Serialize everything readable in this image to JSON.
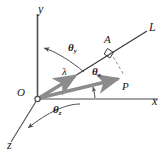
{
  "figure": {
    "colors": {
      "axis": "#4d4d4d",
      "line": "#3a3a3a",
      "vector": "#8c8c8c",
      "arc": "#4d4d4d",
      "text": "#1a1a1a",
      "background": "#ffffff"
    },
    "axes": [
      {
        "name": "y-axis",
        "label": "y",
        "x": 40,
        "y": 8
      },
      {
        "name": "x-axis",
        "label": "x",
        "x": 154,
        "y": 101
      },
      {
        "name": "z-axis",
        "label": "z",
        "x": 10,
        "y": 146
      }
    ],
    "points": [
      {
        "name": "origin",
        "label": "O",
        "x": 20,
        "y": 93
      },
      {
        "name": "point-a",
        "label": "A",
        "x": 107,
        "y": 41
      },
      {
        "name": "point-p",
        "label": "P",
        "x": 124,
        "y": 86
      },
      {
        "name": "line-l",
        "label": "L",
        "x": 150,
        "y": 27
      }
    ],
    "vectors": [
      {
        "name": "lambda-vector",
        "label": "λ",
        "label_x": 64,
        "label_y": 72
      },
      {
        "name": "op-vector",
        "label": "",
        "label_x": 0,
        "label_y": 0
      }
    ],
    "angles": [
      {
        "name": "theta-y",
        "symbol": "θ",
        "subscript": "y",
        "x": 70,
        "y": 47
      },
      {
        "name": "theta-x",
        "symbol": "θ",
        "subscript": "x",
        "x": 94,
        "y": 71
      },
      {
        "name": "theta-z",
        "symbol": "θ",
        "subscript": "z",
        "x": 55,
        "y": 108
      }
    ],
    "markers": [
      {
        "name": "right-angle-marker",
        "label": ""
      }
    ]
  }
}
